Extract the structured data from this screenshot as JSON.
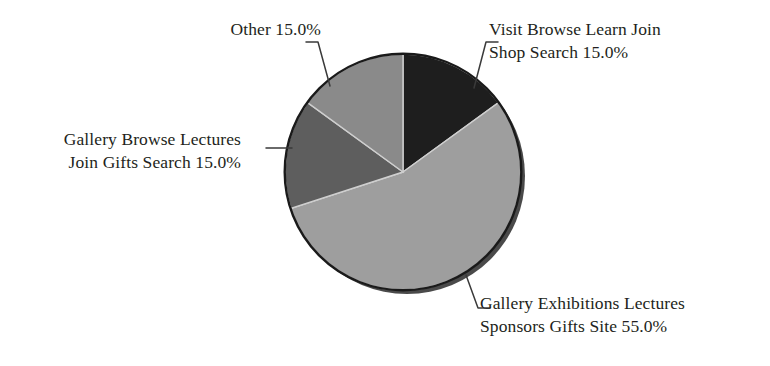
{
  "chart_data": {
    "type": "pie",
    "title": "",
    "xlabel": "",
    "ylabel": "",
    "legend_position": "none",
    "grid": false,
    "start_angle_deg": 0,
    "direction": "clockwise",
    "center": {
      "x": 403,
      "y": 172
    },
    "radius": 118,
    "categories": [
      "Visit Browse Learn Join Shop Search",
      "Gallery Exhibitions Lectures Sponsors Gifts Site",
      "Gallery Browse Lectures Join Gifts Search",
      "Other"
    ],
    "values": [
      15.0,
      55.0,
      15.0,
      15.0
    ],
    "value_suffix": "%",
    "colors": [
      "#1e1e1e",
      "#9e9e9e",
      "#5e5e5e",
      "#8a8a8a"
    ],
    "slices": [
      {
        "label": "Visit Browse Learn Join Shop Search",
        "value": 15.0,
        "display": "15.0%",
        "color": "#1e1e1e",
        "start_deg": 0,
        "end_deg": 54,
        "label_lines": [
          "Visit Browse Learn Join",
          "Shop Search 15.0%"
        ],
        "label_side": "right"
      },
      {
        "label": "Gallery Exhibitions Lectures Sponsors Gifts Site",
        "value": 55.0,
        "display": "55.0%",
        "color": "#9e9e9e",
        "start_deg": 54,
        "end_deg": 252,
        "label_lines": [
          "Gallery Exhibitions Lectures",
          "Sponsors Gifts Site 55.0%"
        ],
        "label_side": "right"
      },
      {
        "label": "Gallery Browse Lectures Join Gifts Search",
        "value": 15.0,
        "display": "15.0%",
        "color": "#5e5e5e",
        "start_deg": 252,
        "end_deg": 306,
        "label_lines": [
          "Gallery Browse Lectures",
          "Join Gifts Search 15.0%"
        ],
        "label_side": "left"
      },
      {
        "label": "Other",
        "value": 15.0,
        "display": "15.0%",
        "color": "#8a8a8a",
        "start_deg": 306,
        "end_deg": 360,
        "label_lines": [
          "Other 15.0%"
        ],
        "label_side": "left"
      }
    ]
  },
  "figure": {
    "background_color": "#ffffff",
    "text_color": "#231f20",
    "outline_color": "#1a1a1a",
    "shadow_color": "#4a4a4a"
  }
}
